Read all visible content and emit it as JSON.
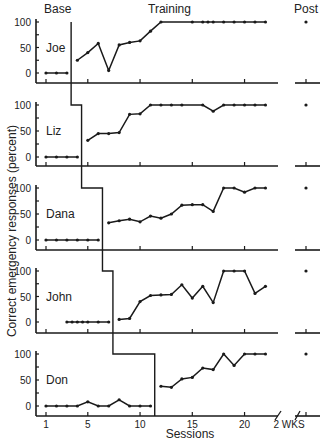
{
  "headers": {
    "base": "Base",
    "training": "Training",
    "post": "Post"
  },
  "axis": {
    "xlabel": "Sessions",
    "ylabel": "Correct emergency responses (percent)",
    "post_tick_label": "2 WKS"
  },
  "chart_data": {
    "type": "line",
    "title": "",
    "xlabel": "Sessions",
    "ylabel": "Correct emergency responses (percent)",
    "xlim": [
      1,
      22
    ],
    "ylim": [
      0,
      100
    ],
    "x_ticks": [
      1,
      5,
      10,
      15,
      20
    ],
    "y_ticks": [
      0,
      50,
      100
    ],
    "post_label": "2 WKS",
    "phases": [
      "Base",
      "Training",
      "Post"
    ],
    "series": [
      {
        "name": "Joe",
        "phase_change_after": 3,
        "baseline": {
          "x": [
            1,
            2,
            3
          ],
          "y": [
            0,
            0,
            0
          ]
        },
        "training": {
          "x": [
            4,
            5,
            6,
            7,
            8,
            9,
            10,
            11,
            12,
            15,
            16,
            16.5,
            17,
            18,
            19,
            20,
            21,
            22
          ],
          "y": [
            25,
            40,
            58,
            5,
            55,
            60,
            63,
            82,
            100,
            100,
            100,
            100,
            100,
            100,
            100,
            100,
            100,
            100
          ]
        },
        "post": 100
      },
      {
        "name": "Liz",
        "phase_change_after": 4,
        "baseline": {
          "x": [
            1,
            2,
            3,
            4
          ],
          "y": [
            0,
            0,
            0,
            0
          ]
        },
        "training": {
          "x": [
            5,
            6,
            7,
            8,
            9,
            10,
            11,
            12,
            13,
            14,
            16,
            17,
            18,
            19,
            20,
            21,
            22
          ],
          "y": [
            32,
            45,
            45,
            47,
            82,
            83,
            100,
            100,
            100,
            100,
            100,
            88,
            100,
            100,
            100,
            100,
            100
          ]
        },
        "post": 100
      },
      {
        "name": "Dana",
        "phase_change_after": 6,
        "baseline": {
          "x": [
            1,
            2,
            3,
            4,
            5,
            6
          ],
          "y": [
            0,
            0,
            0,
            0,
            0,
            0
          ]
        },
        "training": {
          "x": [
            7,
            8,
            9,
            10,
            11,
            12,
            13,
            14,
            15,
            16,
            17,
            18,
            19,
            20,
            21,
            22
          ],
          "y": [
            33,
            37,
            40,
            35,
            46,
            42,
            50,
            67,
            68,
            68,
            55,
            100,
            100,
            92,
            100,
            100
          ]
        },
        "post": 100
      },
      {
        "name": "John",
        "phase_change_after": 7,
        "baseline": {
          "x": [
            3,
            3.5,
            4,
            4.5,
            5,
            6,
            7
          ],
          "y": [
            0,
            0,
            0,
            0,
            0,
            0,
            0
          ]
        },
        "training": {
          "x": [
            8,
            9,
            10,
            11,
            12,
            13,
            14,
            15,
            16,
            17,
            18,
            19,
            20,
            21,
            22
          ],
          "y": [
            5,
            7,
            40,
            52,
            53,
            54,
            73,
            47,
            70,
            38,
            100,
            100,
            100,
            56,
            70
          ]
        },
        "post": 100
      },
      {
        "name": "Don",
        "phase_change_after": 11,
        "baseline": {
          "x": [
            1,
            2,
            3,
            4,
            5,
            6,
            7,
            8,
            9,
            10,
            11
          ],
          "y": [
            0,
            0,
            0,
            0,
            8,
            0,
            0,
            12,
            0,
            0,
            0
          ]
        },
        "training": {
          "x": [
            12,
            13,
            14,
            15,
            16,
            17,
            18,
            19,
            20,
            21,
            22
          ],
          "y": [
            38,
            36,
            52,
            55,
            73,
            70,
            100,
            78,
            100,
            100,
            100
          ]
        },
        "post": 100
      }
    ],
    "grid": false,
    "legend": "none (participant names labeled inside each panel)"
  }
}
